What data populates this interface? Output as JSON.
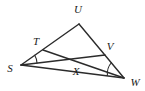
{
  "figure": {
    "background_color": "#ffffff",
    "line_color": "#2b2b2b",
    "label_color": "#1a1a1a",
    "points": {
      "S": {
        "label": "S",
        "x": 21,
        "y": 65,
        "label_x": 10,
        "label_y": 69
      },
      "U": {
        "label": "U",
        "x": 79,
        "y": 24,
        "label_x": 78,
        "label_y": 10
      },
      "W": {
        "label": "W",
        "x": 124,
        "y": 78,
        "label_x": 135,
        "label_y": 83
      },
      "T": {
        "label": "T",
        "x": 43,
        "y": 50,
        "label_x": 36,
        "label_y": 42
      },
      "V": {
        "label": "V",
        "x": 105,
        "y": 55,
        "label_x": 110,
        "label_y": 47
      },
      "X": {
        "label": "X",
        "x": 73,
        "y": 63,
        "label_x": 76,
        "label_y": 72
      }
    },
    "segments": [
      {
        "name": "segment-SU",
        "from": "S",
        "to": "U"
      },
      {
        "name": "segment-UW",
        "from": "U",
        "to": "W"
      },
      {
        "name": "segment-SW",
        "from": "S",
        "to": "W"
      },
      {
        "name": "segment-TW",
        "from": "T",
        "to": "W"
      },
      {
        "name": "segment-SV",
        "from": "S",
        "to": "V"
      }
    ],
    "angle_marks": [
      {
        "name": "angle-mark-S",
        "vertex": "S"
      },
      {
        "name": "angle-mark-W",
        "vertex": "W"
      }
    ]
  }
}
